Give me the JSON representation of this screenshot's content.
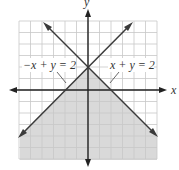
{
  "figure": {
    "x_axis_label": "x",
    "y_axis_label": "y",
    "grid": {
      "min": -6,
      "max": 6,
      "step": 1
    },
    "lines": [
      {
        "equation": "-x + y = 2",
        "label": "−x + y = 2"
      },
      {
        "equation": "x + y = 2",
        "label": "x + y = 2"
      }
    ],
    "shaded_region": "y ≤ 2 − |x| (below both lines)",
    "colors": {
      "shade": "#d9d9d9",
      "grid": "#c8c8c8",
      "line": "#3a3a3a"
    }
  }
}
